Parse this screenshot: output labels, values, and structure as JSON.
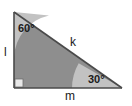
{
  "diagram": {
    "type": "right-triangle-geometry",
    "colors": {
      "background": "#ffffff",
      "interior_fill": "#8e8e8e",
      "angle_arc_fill": "#c2c2c2",
      "outline": "#4a4a4a",
      "right_angle_marker": "#e8e8e8",
      "label_text": "#1a1a1a"
    },
    "vertices": {
      "top_left": {
        "x": 14,
        "y": 12
      },
      "bottom_left": {
        "x": 14,
        "y": 88
      },
      "bottom_right": {
        "x": 122,
        "y": 88
      }
    },
    "angles": [
      {
        "name": "top-left-angle",
        "label": "60°",
        "value": 60,
        "unit": "degrees",
        "vertex": "top_left",
        "marker": "arc"
      },
      {
        "name": "bottom-right-angle",
        "label": "30°",
        "value": 30,
        "unit": "degrees",
        "vertex": "bottom_right",
        "marker": "arc"
      },
      {
        "name": "bottom-left-angle",
        "label": "",
        "value": 90,
        "unit": "degrees",
        "vertex": "bottom_left",
        "marker": "square"
      }
    ],
    "sides": [
      {
        "name": "left-side",
        "label": "l",
        "from": "top_left",
        "to": "bottom_left",
        "role": "vertical-leg"
      },
      {
        "name": "hypotenuse",
        "label": "k",
        "from": "top_left",
        "to": "bottom_right",
        "role": "hypotenuse"
      },
      {
        "name": "bottom-side",
        "label": "m",
        "from": "bottom_left",
        "to": "bottom_right",
        "role": "horizontal-leg"
      }
    ]
  }
}
